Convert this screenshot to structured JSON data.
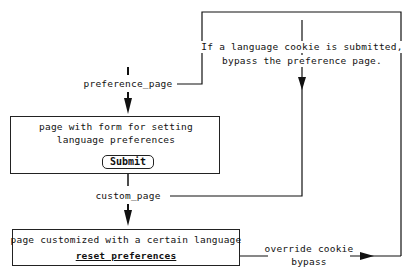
{
  "diagram": {
    "nodes": {
      "preference_page_label": "preference_page",
      "form_page": {
        "line1": "page with form for setting",
        "line2": "language preferences",
        "submit_label": "Submit"
      },
      "custom_page_label": "custom_page",
      "custom_page_box": {
        "line1": "page customized with a certain language",
        "reset_link": "reset preferences"
      }
    },
    "annotations": {
      "bypass_note_line1": "If a language cookie is submitted,",
      "bypass_note_line2": "bypass the preference page.",
      "override_line1": "override cookie",
      "override_line2": "bypass"
    },
    "colors": {
      "stroke": "#222222",
      "background": "#ffffff"
    }
  }
}
